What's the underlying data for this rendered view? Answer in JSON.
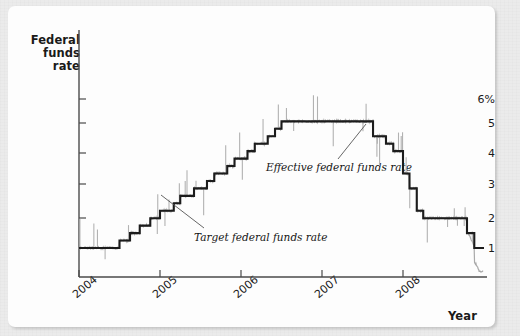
{
  "figure": {
    "background_color": "#ebebeb",
    "panel_color": "#fdfdfd"
  },
  "axes": {
    "y_title": [
      "Federal",
      "funds",
      "rate"
    ],
    "x_title": "Year",
    "y_ticks": [
      "6%",
      "5",
      "4",
      "3",
      "2",
      "1"
    ],
    "x_ticks": [
      "2004",
      "2005",
      "2006",
      "2007",
      "2008"
    ]
  },
  "annotations": [
    {
      "id": "target",
      "text": "Target federal funds rate"
    },
    {
      "id": "effective",
      "text": "Effective federal funds rate"
    }
  ],
  "chart_data": {
    "type": "line",
    "title": "",
    "xlabel": "Year",
    "ylabel": "Federal funds rate",
    "xlim": [
      2004.0,
      2009.0
    ],
    "ylim": [
      0.0,
      6.6
    ],
    "ytick_values": [
      6,
      5,
      4,
      3,
      2,
      1
    ],
    "ytick_labels": [
      "6%",
      "5",
      "4",
      "3",
      "2",
      "1"
    ],
    "xtick_values": [
      2004,
      2005,
      2006,
      2007,
      2008
    ],
    "xtick_labels": [
      "2004",
      "2005",
      "2006",
      "2007",
      "2008"
    ],
    "grid": false,
    "legend": "annotated-inline",
    "series": [
      {
        "name": "Target federal funds rate",
        "color": "#1c1c1c",
        "style": "step",
        "width": 2.0,
        "x": [
          2004.0,
          2004.5,
          2004.5,
          2004.63,
          2004.63,
          2004.75,
          2004.75,
          2004.88,
          2004.88,
          2005.0,
          2005.0,
          2005.17,
          2005.17,
          2005.25,
          2005.25,
          2005.42,
          2005.42,
          2005.58,
          2005.58,
          2005.67,
          2005.67,
          2005.83,
          2005.83,
          2005.92,
          2005.92,
          2006.08,
          2006.08,
          2006.17,
          2006.17,
          2006.33,
          2006.33,
          2006.42,
          2006.42,
          2006.5,
          2006.5,
          2007.63,
          2007.63,
          2007.79,
          2007.79,
          2007.88,
          2007.88,
          2008.0,
          2008.0,
          2008.08,
          2008.08,
          2008.17,
          2008.17,
          2008.25,
          2008.25,
          2008.33,
          2008.33,
          2008.79,
          2008.79,
          2008.88,
          2008.88,
          2008.96,
          2008.96,
          2009.0
        ],
        "y": [
          1.0,
          1.0,
          1.25,
          1.25,
          1.5,
          1.5,
          1.75,
          1.75,
          2.0,
          2.0,
          2.25,
          2.25,
          2.5,
          2.5,
          2.75,
          2.75,
          3.0,
          3.0,
          3.25,
          3.25,
          3.5,
          3.5,
          3.75,
          3.75,
          4.0,
          4.0,
          4.25,
          4.25,
          4.5,
          4.5,
          4.75,
          4.75,
          5.0,
          5.0,
          5.25,
          5.25,
          4.75,
          4.75,
          4.5,
          4.5,
          4.25,
          4.25,
          3.5,
          3.5,
          3.0,
          3.0,
          2.25,
          2.25,
          2.0,
          2.0,
          2.0,
          2.0,
          1.5,
          1.5,
          1.0,
          1.0,
          1.0,
          1.0
        ]
      },
      {
        "name": "Effective federal funds rate",
        "color": "#a8a8a8",
        "style": "noisy-line",
        "width": 1.2,
        "note": "tracks the target closely with daily volatility spikes; falls toward 0.2 at the end of 2008"
      }
    ],
    "key_events": {
      "flat_at_1pct_through": 2004.5,
      "plateau_value": 5.25,
      "plateau_range": [
        2006.5,
        2007.63
      ],
      "final_target": 1.0,
      "final_effective_low": 0.2
    }
  }
}
